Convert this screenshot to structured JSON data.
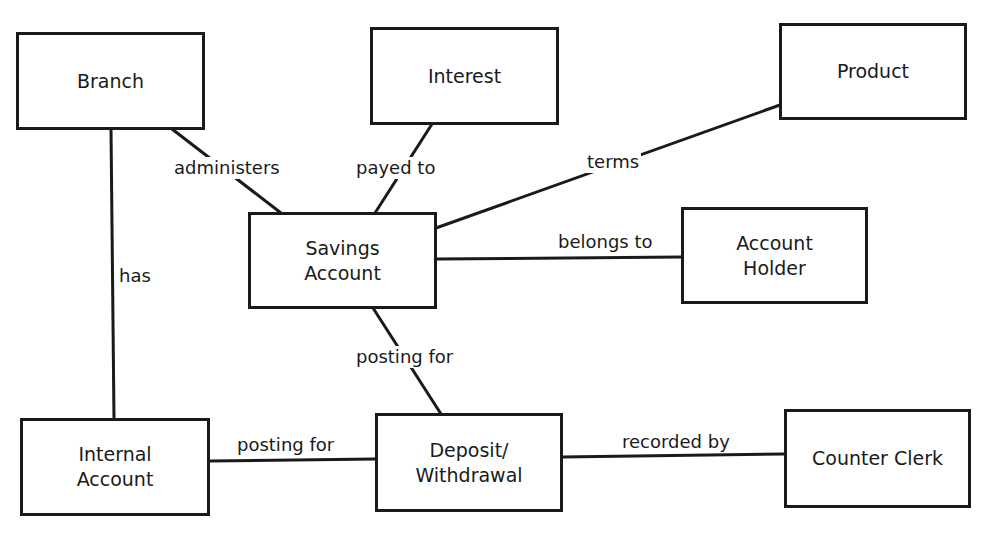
{
  "diagram": {
    "type": "entity-relationship",
    "nodes": [
      {
        "id": "branch",
        "label": "Branch"
      },
      {
        "id": "interest",
        "label": "Interest"
      },
      {
        "id": "product",
        "label": "Product"
      },
      {
        "id": "savings_account",
        "label": "Savings\nAccount"
      },
      {
        "id": "account_holder",
        "label": "Account\nHolder"
      },
      {
        "id": "internal_account",
        "label": "Internal\nAccount"
      },
      {
        "id": "deposit_withdrawal",
        "label": "Deposit/\nWithdrawal"
      },
      {
        "id": "counter_clerk",
        "label": "Counter Clerk"
      }
    ],
    "edges": [
      {
        "from": "branch",
        "to": "savings_account",
        "label": "administers"
      },
      {
        "from": "interest",
        "to": "savings_account",
        "label": "payed to"
      },
      {
        "from": "product",
        "to": "savings_account",
        "label": "terms"
      },
      {
        "from": "savings_account",
        "to": "account_holder",
        "label": "belongs to"
      },
      {
        "from": "branch",
        "to": "internal_account",
        "label": "has"
      },
      {
        "from": "deposit_withdrawal",
        "to": "savings_account",
        "label": "posting for"
      },
      {
        "from": "deposit_withdrawal",
        "to": "internal_account",
        "label": "posting for"
      },
      {
        "from": "deposit_withdrawal",
        "to": "counter_clerk",
        "label": "recorded by"
      }
    ]
  },
  "colors": {
    "stroke": "#1a1a1a",
    "background": "#ffffff"
  }
}
